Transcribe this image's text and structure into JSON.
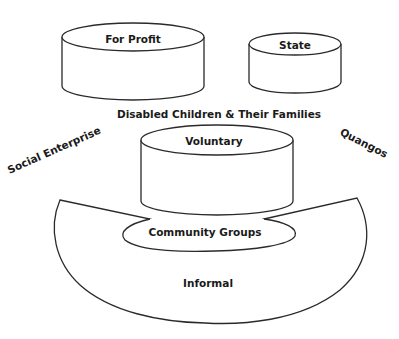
{
  "diagram": {
    "center_label": "Disabled Children & Their Families",
    "shapes": {
      "for_profit": {
        "label": "For Profit",
        "shape": "cylinder"
      },
      "state": {
        "label": "State",
        "shape": "cylinder"
      },
      "voluntary": {
        "label": "Voluntary",
        "shape": "cylinder"
      },
      "community_groups": {
        "label": "Community Groups",
        "shape": "ellipse"
      },
      "informal": {
        "label": "Informal",
        "shape": "bowl"
      }
    },
    "side_labels": {
      "left": "Social Enterprise",
      "right": "Quangos"
    },
    "colors": {
      "stroke": "#2a2a2a",
      "fill": "#ffffff",
      "text": "#1a1a1a"
    }
  }
}
